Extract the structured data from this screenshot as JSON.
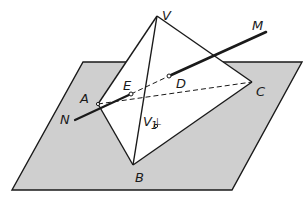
{
  "diagram": {
    "type": "geometry",
    "colors": {
      "plane_fill": "#cfcfcf",
      "stroke": "#1a1a1a",
      "face": "#ffffff"
    },
    "labels": {
      "V": "V",
      "M": "M",
      "D": "D",
      "E": "E",
      "A": "A",
      "N": "N",
      "C": "C",
      "V1": "V",
      "V1_sub": "1",
      "perp": "⊥",
      "B": "B"
    },
    "points": {
      "V": [
        157,
        16
      ],
      "A": [
        98,
        104
      ],
      "B": [
        133,
        165
      ],
      "C": [
        252,
        82
      ],
      "D": [
        169,
        76
      ],
      "E": [
        131,
        94
      ],
      "M": [
        266,
        32
      ],
      "N": [
        75,
        120
      ],
      "V1": [
        153,
        126
      ]
    }
  }
}
